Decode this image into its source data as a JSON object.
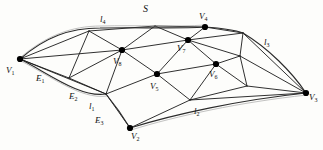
{
  "figure": {
    "surface_label": "S",
    "stroke_color": "#1a1a1a",
    "vertex_color": "#000000",
    "background": "#fdfdfb",
    "canvas": {
      "width": 323,
      "height": 150
    }
  },
  "labels": {
    "surface": {
      "text": "S",
      "x": 143,
      "y": 4
    },
    "v1": {
      "text": "V",
      "sub": "1",
      "x": 6,
      "y": 66
    },
    "v2": {
      "text": "V",
      "sub": "2",
      "x": 131,
      "y": 132
    },
    "v3": {
      "text": "V",
      "sub": "3",
      "x": 307,
      "y": 93
    },
    "v4": {
      "text": "V",
      "sub": "4",
      "x": 199,
      "y": 13
    },
    "v5": {
      "text": "V",
      "sub": "5",
      "x": 150,
      "y": 82
    },
    "v6": {
      "text": "V",
      "sub": "6",
      "x": 208,
      "y": 71
    },
    "v7": {
      "text": "V",
      "sub": "7",
      "x": 176,
      "y": 44
    },
    "v8": {
      "text": "V",
      "sub": "8",
      "x": 113,
      "y": 58
    },
    "e1": {
      "text": "E",
      "sub": "1",
      "x": 36,
      "y": 75
    },
    "e2": {
      "text": "E",
      "sub": "2",
      "x": 70,
      "y": 92
    },
    "e3": {
      "text": "E",
      "sub": "3",
      "x": 96,
      "y": 117
    },
    "l1": {
      "text": "l",
      "sub": "1",
      "x": 88,
      "y": 103
    },
    "l2": {
      "text": "l",
      "sub": "2",
      "x": 194,
      "y": 108
    },
    "l3": {
      "text": "l",
      "sub": "3",
      "x": 264,
      "y": 39
    },
    "l4": {
      "text": "l",
      "sub": "4",
      "x": 100,
      "y": 16
    }
  },
  "vertices": {
    "V1": {
      "x": 20,
      "y": 59
    },
    "V2": {
      "x": 130,
      "y": 128
    },
    "V3": {
      "x": 306,
      "y": 93
    },
    "V4": {
      "x": 205,
      "y": 27
    },
    "V5": {
      "x": 157,
      "y": 74
    },
    "V6": {
      "x": 216,
      "y": 64
    },
    "V7": {
      "x": 188,
      "y": 40
    },
    "V8": {
      "x": 122,
      "y": 50
    },
    "A": {
      "x": 89,
      "y": 31
    },
    "B": {
      "x": 155,
      "y": 26
    },
    "C": {
      "x": 243,
      "y": 33
    },
    "D": {
      "x": 69,
      "y": 78
    },
    "E": {
      "x": 106,
      "y": 94
    },
    "F": {
      "x": 190,
      "y": 100
    },
    "G": {
      "x": 247,
      "y": 86
    },
    "H": {
      "x": 240,
      "y": 56
    }
  },
  "edges": [
    [
      "V1",
      "A"
    ],
    [
      "V1",
      "V8"
    ],
    [
      "V1",
      "D"
    ],
    [
      "V1",
      "E"
    ],
    [
      "A",
      "B"
    ],
    [
      "A",
      "V8"
    ],
    [
      "A",
      "D"
    ],
    [
      "B",
      "V8"
    ],
    [
      "B",
      "V7"
    ],
    [
      "B",
      "V4"
    ],
    [
      "V4",
      "V7"
    ],
    [
      "V4",
      "C"
    ],
    [
      "C",
      "V7"
    ],
    [
      "C",
      "H"
    ],
    [
      "C",
      "V3"
    ],
    [
      "V8",
      "V7"
    ],
    [
      "V8",
      "V5"
    ],
    [
      "V8",
      "D"
    ],
    [
      "V8",
      "E"
    ],
    [
      "V7",
      "V5"
    ],
    [
      "V7",
      "V6"
    ],
    [
      "V7",
      "H"
    ],
    [
      "V6",
      "V5"
    ],
    [
      "V6",
      "H"
    ],
    [
      "V6",
      "G"
    ],
    [
      "V6",
      "F"
    ],
    [
      "H",
      "V3"
    ],
    [
      "H",
      "G"
    ],
    [
      "G",
      "V3"
    ],
    [
      "G",
      "F"
    ],
    [
      "V5",
      "E"
    ],
    [
      "V5",
      "F"
    ],
    [
      "D",
      "E"
    ],
    [
      "E",
      "V2"
    ],
    [
      "V2",
      "F"
    ],
    [
      "F",
      "V3"
    ]
  ],
  "boundary_curves": {
    "top_left": "l4",
    "bottom_left": "l1",
    "bottom_right": "l2",
    "right": "l3"
  }
}
